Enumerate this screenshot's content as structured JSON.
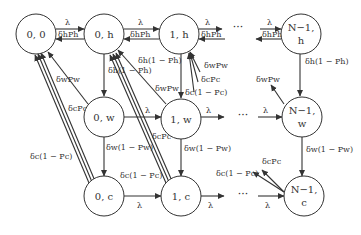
{
  "diagram": {
    "colors": {
      "stroke": "#333333",
      "background": "#ffffff"
    },
    "nodes": {
      "n00": {
        "line1": "0, 0",
        "line2": ""
      },
      "n0h": {
        "line1": "0, h",
        "line2": ""
      },
      "n1h": {
        "line1": "1, h",
        "line2": ""
      },
      "nNh": {
        "line1": "N−1,",
        "line2": "h"
      },
      "n0w": {
        "line1": "0, w",
        "line2": ""
      },
      "n1w": {
        "line1": "1, w",
        "line2": ""
      },
      "nNw": {
        "line1": "N−1,",
        "line2": "w"
      },
      "n0c": {
        "line1": "0, c",
        "line2": ""
      },
      "n1c": {
        "line1": "1, c",
        "line2": ""
      },
      "nNc": {
        "line1": "N−1,",
        "line2": "c"
      }
    },
    "ellipsis": "···",
    "labels": {
      "lambda": "λ",
      "dh_ph": "δhPh",
      "dh_1ph": "δh(1 − Ph)",
      "dw_pw": "δwPw",
      "dw_1pw": "δw(1 − Pw)",
      "dc_pc": "δcPc",
      "dc_1pc": "δc(1 − Pc)"
    }
  }
}
